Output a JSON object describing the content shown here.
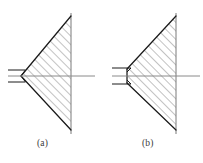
{
  "figure": {
    "background_color": "#ffffff",
    "outline_color": "#1a1a1a",
    "hatch_color": "#6e6e6e",
    "centerline_color": "#8a8a8a",
    "boundary_color": "#7a7a7a",
    "caption_color": "#3a3a3a",
    "hatch_angle_deg": 45,
    "hatch_spacing_px": 6
  },
  "panels": [
    {
      "id": "a",
      "label": "(a)",
      "tip_type": "sharp-point",
      "description": "Wedge with sharp pointed tip",
      "geometry": {
        "tip_x": 21,
        "tip_y": 76,
        "top_vertex_x": 71,
        "top_vertex_y": 16,
        "bottom_vertex_x": 71,
        "bottom_vertex_y": 130,
        "boundary_line_x": 71,
        "boundary_top_y": 13,
        "boundary_bottom_y": 134,
        "centerline_y": 76,
        "centerline_x1": 8,
        "centerline_x2": 95,
        "lead_line_upper_y": 70,
        "lead_line_lower_y": 82,
        "lead_line_x1": 8,
        "lead_line_x2": 24
      }
    },
    {
      "id": "b",
      "label": "(b)",
      "tip_type": "truncated-flat",
      "description": "Wedge with truncated flat tip",
      "geometry": {
        "tip_x": 127,
        "tip_top_y": 69,
        "tip_bottom_y": 83,
        "top_vertex_x": 176,
        "top_vertex_y": 16,
        "bottom_vertex_x": 176,
        "bottom_vertex_y": 130,
        "boundary_line_x": 176,
        "boundary_top_y": 13,
        "boundary_bottom_y": 134,
        "centerline_y": 76,
        "centerline_x1": 112,
        "centerline_x2": 200,
        "lead_line_upper_y": 68,
        "lead_line_lower_y": 84,
        "lead_line_x1": 112,
        "lead_line_x2": 130
      }
    }
  ]
}
